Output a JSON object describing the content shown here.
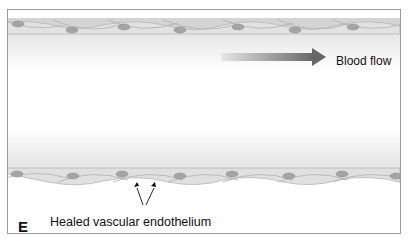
{
  "figure": {
    "panel_letter": "E",
    "blood_flow_label": "Blood flow",
    "endothelium_label": "Healed vascular endothelium",
    "colors": {
      "cell_fill": "#d9d9d9",
      "cell_stroke": "#a8a8a8",
      "nucleus_fill": "#9c9c9c",
      "arrow_dark": "#6b6b6b",
      "arrow_light": "#e4e4e4",
      "frame_border": "#9a9a9a"
    }
  }
}
